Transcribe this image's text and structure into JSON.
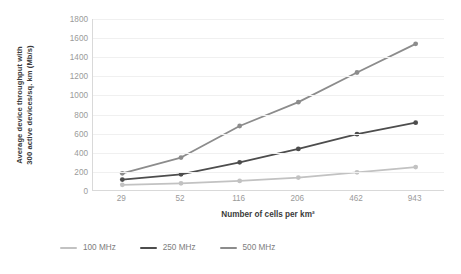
{
  "chart_data": {
    "type": "line",
    "title": "",
    "xlabel": "Number of cells per km²",
    "ylabel": "Average device throughput with 300 active devices/sq. km (Mb/s)",
    "ylabel_line1": "Average device throughput with",
    "ylabel_line2": "300 active devices/sq. km (Mb/s)",
    "categories": [
      "29",
      "52",
      "116",
      "206",
      "462",
      "943"
    ],
    "ylim": [
      0,
      1800
    ],
    "yticks": [
      0,
      200,
      400,
      600,
      800,
      1000,
      1200,
      1400,
      1600,
      1800
    ],
    "ytick_labels": [
      "0",
      "200",
      "400",
      "600",
      "800",
      "1000",
      "1200",
      "1400",
      "1600",
      "1800"
    ],
    "grid": true,
    "grid_axis": "y",
    "legend_position": "bottom",
    "series": [
      {
        "name": "100 MHz",
        "color": "#c2c2c2",
        "values": [
          65,
          80,
          105,
          140,
          195,
          250
        ]
      },
      {
        "name": "250 MHz",
        "color": "#4d4d4d",
        "values": [
          120,
          175,
          300,
          440,
          595,
          715
        ]
      },
      {
        "name": "500 MHz",
        "color": "#8c8c8c",
        "values": [
          185,
          350,
          680,
          930,
          1240,
          1540
        ]
      }
    ]
  },
  "legend": {
    "items": [
      {
        "label": "100 MHz",
        "color": "#c2c2c2"
      },
      {
        "label": "250 MHz",
        "color": "#4d4d4d"
      },
      {
        "label": "500 MHz",
        "color": "#8c8c8c"
      }
    ]
  },
  "colors": {
    "axis": "#d9d9d9",
    "grid": "#f0f0f0",
    "tick_text": "#9a9a9a",
    "axis_title": "#3b3b3b",
    "background": "#ffffff"
  }
}
